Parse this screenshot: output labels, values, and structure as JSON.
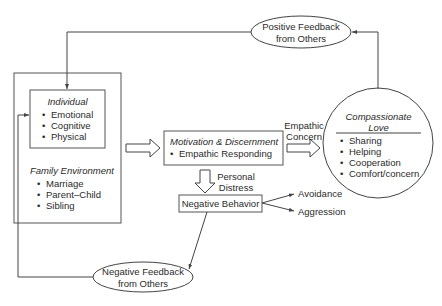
{
  "diagram": {
    "type": "flow-model",
    "individual_box": {
      "title": "Individual",
      "items": [
        "Emotional",
        "Cognitive",
        "Physical"
      ]
    },
    "family_environment": {
      "title": "Family Environment",
      "items": [
        "Marriage",
        "Parent–Child",
        "Sibling"
      ]
    },
    "motivation_box": {
      "title": "Motivation & Discernment",
      "items": [
        "Empathic Responding"
      ]
    },
    "empathic_concern_label": [
      "Empathic",
      "Concern"
    ],
    "personal_distress_label": [
      "Personal",
      "Distress"
    ],
    "compassionate_love": {
      "title_line1": "Compassionate",
      "title_line2": "Love",
      "items": [
        "Sharing",
        "Helping",
        "Cooperation",
        "Comfort/concern"
      ]
    },
    "negative_behavior_box": {
      "label": "Negative Behavior"
    },
    "outcomes": [
      "Avoidance",
      "Aggression"
    ],
    "positive_feedback": {
      "line1": "Positive Feedback",
      "line2": "from Others"
    },
    "negative_feedback": {
      "line1": "Negative Feedback",
      "line2": "from Others"
    },
    "colors": {
      "line": "#444444",
      "text": "#2a2a2a",
      "background": "#ffffff"
    }
  }
}
